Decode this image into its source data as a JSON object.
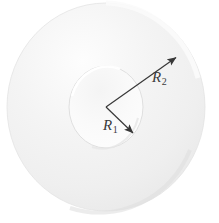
{
  "figure": {
    "name": "annulus-disc-diagram",
    "background_color": "#ffffff"
  },
  "shapes": {
    "outer_disc": {
      "name": "outer-disc",
      "center_x": 106,
      "center_y": 107,
      "radius_x": 99,
      "radius_y": 104,
      "fill_color": "#f2f2f2",
      "edge_color": "#e2e2e2"
    },
    "inner_hole": {
      "name": "inner-hole",
      "center_x": 106,
      "center_y": 107,
      "radius_x": 37,
      "radius_y": 41,
      "fill_color": "#f7f7f7",
      "edge_color": "#dedede"
    }
  },
  "arrows": [
    {
      "id": "r2",
      "label_text": "R",
      "label_subscript": "2",
      "from_x": 106,
      "from_y": 107,
      "to_x": 178,
      "to_y": 56,
      "color": "#404040"
    },
    {
      "id": "r1",
      "label_text": "R",
      "label_subscript": "1",
      "from_x": 106,
      "from_y": 107,
      "to_x": 135,
      "to_y": 135,
      "color": "#404040"
    }
  ],
  "labels": {
    "r2": {
      "text": "R",
      "subscript": "2"
    },
    "r1": {
      "text": "R",
      "subscript": "1"
    }
  },
  "colors": {
    "background": "#ffffff",
    "disc_light": "#fbfbfb",
    "disc_mid": "#f0f0f0",
    "disc_shadow": "#e6e6e6",
    "line": "#404040",
    "text": "#3b3b3b"
  }
}
